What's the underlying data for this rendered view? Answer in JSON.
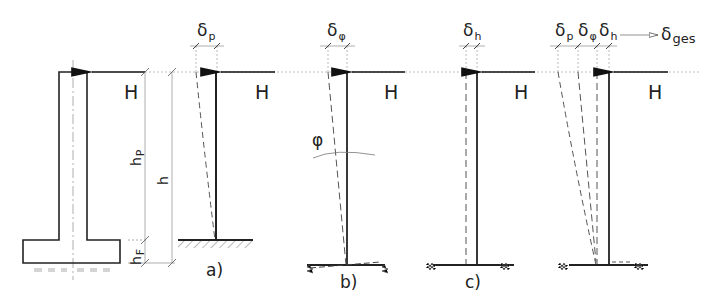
{
  "figure": {
    "force_label": "H",
    "panels": [
      {
        "id": "a",
        "label": "a)",
        "description": "Column bending (fixed base)",
        "deflection": {
          "symbol": "δ",
          "sub": "p"
        }
      },
      {
        "id": "b",
        "label": "b)",
        "description": "Foundation rotation",
        "deflection": {
          "symbol": "δ",
          "sub": "φ"
        },
        "angle_label": "φ"
      },
      {
        "id": "c",
        "label": "c)",
        "description": "Foundation horizontal displacement",
        "deflection": {
          "symbol": "δ",
          "sub": "h"
        }
      },
      {
        "id": "d",
        "label": "",
        "description": "Total superposition",
        "deflections": [
          {
            "symbol": "δ",
            "sub": "p"
          },
          {
            "symbol": "δ",
            "sub": "φ"
          },
          {
            "symbol": "δ",
            "sub": "h"
          }
        ],
        "total": {
          "symbol": "δ",
          "sub": "ges"
        }
      }
    ],
    "dimensions": {
      "pier_height": {
        "symbol": "h",
        "sub": "P"
      },
      "total_height": {
        "symbol": "h",
        "sub": ""
      },
      "foundation_height": {
        "symbol": "h",
        "sub": "F"
      }
    },
    "colors": {
      "line": "#222222",
      "dim": "#9a9a9a",
      "ground": "#666666"
    }
  }
}
